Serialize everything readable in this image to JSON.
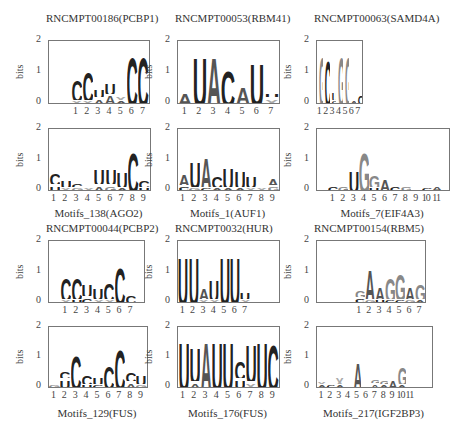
{
  "colors": {
    "dark": "#222222",
    "mid": "#555555",
    "light": "#888888",
    "lighter": "#aaaaaa"
  },
  "axis": {
    "ylabel": "bits",
    "yticks": [
      "0",
      "1",
      "2"
    ]
  },
  "chart_data": [
    {
      "type": "sequence-logo",
      "title": "RNCMPT00186(PCBP1)",
      "caption": "",
      "ylabel": "bits",
      "ylim": [
        0,
        2
      ],
      "positions": [
        "1",
        "2",
        "3",
        "4",
        "5",
        "6",
        "7"
      ],
      "stacks": [
        [
          [
            "X",
            0.1
          ],
          [
            "C",
            0.8
          ]
        ],
        [
          [
            "X",
            0.1
          ],
          [
            "C",
            1.1
          ]
        ],
        [
          [
            "A",
            0.2
          ],
          [
            "U",
            0.3
          ]
        ],
        [
          [
            "A",
            0.3
          ],
          [
            "U",
            0.4
          ]
        ],
        [
          [
            "A",
            0.1
          ],
          [
            "X",
            0.2
          ]
        ],
        [
          [
            "C",
            1.8
          ]
        ],
        [
          [
            "C",
            1.8
          ]
        ]
      ]
    },
    {
      "type": "sequence-logo",
      "title": "RNCMPT00053(RBM41)",
      "caption": "",
      "ylabel": "bits",
      "ylim": [
        0,
        2
      ],
      "positions": [
        "1",
        "2",
        "3",
        "4",
        "5",
        "6",
        "7"
      ],
      "stacks": [
        [
          [
            "A",
            0.4
          ]
        ],
        [
          [
            "U",
            1.8
          ]
        ],
        [
          [
            "A",
            1.8
          ]
        ],
        [
          [
            "C",
            1.3
          ]
        ],
        [
          [
            "A",
            0.6
          ]
        ],
        [
          [
            "U",
            1.6
          ]
        ],
        [
          [
            "X",
            0.2
          ],
          [
            "U",
            0.2
          ]
        ]
      ]
    },
    {
      "type": "sequence-logo",
      "title": "RNCMPT00063(SAMD4A)",
      "caption": "",
      "ylabel": "bits",
      "ylim": [
        0,
        2
      ],
      "positions": [
        "1",
        "2",
        "3",
        "4",
        "5",
        "6",
        "7"
      ],
      "stacks": [
        [
          [
            "G",
            1.8
          ]
        ],
        [
          [
            "C",
            1.7
          ]
        ],
        [
          [
            "C",
            0.1
          ],
          [
            "U",
            0.3
          ]
        ],
        [
          [
            "G",
            1.8
          ]
        ],
        [
          [
            "G",
            1.8
          ]
        ],
        [
          [
            "A",
            0.1
          ]
        ],
        [
          [
            "C",
            0.3
          ]
        ]
      ]
    },
    {
      "type": "sequence-logo",
      "title": "",
      "caption": "Motifs_138(AGO2)",
      "ylabel": "bits",
      "ylim": [
        0,
        2
      ],
      "positions": [
        "1",
        "2",
        "3",
        "4",
        "5",
        "6",
        "7",
        "8",
        "9"
      ],
      "stacks": [
        [
          [
            "U",
            0.2
          ],
          [
            "C",
            0.4
          ]
        ],
        [
          [
            "X",
            0.1
          ],
          [
            "U",
            0.3
          ]
        ],
        [
          [
            "G",
            0.1
          ],
          [
            "C",
            0.2
          ]
        ],
        [
          [
            "X",
            0.1
          ]
        ],
        [
          [
            "A",
            0.2
          ],
          [
            "U",
            0.6
          ]
        ],
        [
          [
            "G",
            0.2
          ],
          [
            "U",
            0.6
          ]
        ],
        [
          [
            "A",
            0.1
          ],
          [
            "U",
            0.6
          ]
        ],
        [
          [
            "C",
            1.5
          ]
        ],
        [
          [
            "U",
            0.1
          ],
          [
            "C",
            0.3
          ]
        ]
      ]
    },
    {
      "type": "sequence-logo",
      "title": "",
      "caption": "Motifs_1(AUF1)",
      "ylabel": "bits",
      "ylim": [
        0,
        2
      ],
      "positions": [
        "1",
        "2",
        "3",
        "4",
        "5",
        "6",
        "7",
        "8",
        "9"
      ],
      "stacks": [
        [
          [
            "C",
            0.15
          ],
          [
            "A",
            0.4
          ]
        ],
        [
          [
            "G",
            0.1
          ],
          [
            "U",
            1.0
          ]
        ],
        [
          [
            "C",
            0.1
          ],
          [
            "A",
            1.2
          ]
        ],
        [
          [
            "A",
            0.1
          ],
          [
            "C",
            0.4
          ]
        ],
        [
          [
            "A",
            0.1
          ],
          [
            "U",
            0.8
          ]
        ],
        [
          [
            "A",
            0.1
          ],
          [
            "U",
            0.7
          ]
        ],
        [
          [
            "X",
            0.1
          ],
          [
            "U",
            0.4
          ]
        ],
        [
          [
            "X",
            0.1
          ]
        ],
        [
          [
            "G",
            0.15
          ],
          [
            "A",
            0.3
          ]
        ]
      ]
    },
    {
      "type": "sequence-logo",
      "title": "",
      "caption": "Motifs_7(EIF4A3)",
      "ylabel": "bits",
      "ylim": [
        0,
        2
      ],
      "positions": [
        "1",
        "2",
        "3",
        "4",
        "5",
        "6",
        "7",
        "8",
        "9",
        "10",
        "11"
      ],
      "stacks": [
        [
          [
            "C",
            0.2
          ]
        ],
        [
          [
            "G",
            0.2
          ]
        ],
        [
          [
            "U",
            0.8
          ]
        ],
        [
          [
            "G",
            1.5
          ]
        ],
        [
          [
            "U",
            0.1
          ],
          [
            "G",
            0.5
          ]
        ],
        [
          [
            "A",
            0.4
          ]
        ],
        [
          [
            "C",
            0.2
          ]
        ],
        [
          [
            "G",
            0.15
          ]
        ],
        [
          [
            "X",
            0.05
          ]
        ],
        [
          [
            "C",
            0.1
          ]
        ],
        [
          [
            "A",
            0.15
          ]
        ]
      ]
    },
    {
      "type": "sequence-logo",
      "title": "RNCMPT00044(PCBP2)",
      "caption": "",
      "ylabel": "bits",
      "ylim": [
        0,
        2
      ],
      "positions": [
        "1",
        "2",
        "3",
        "4",
        "5",
        "6",
        "7"
      ],
      "stacks": [
        [
          [
            "X",
            0.1
          ],
          [
            "C",
            0.9
          ]
        ],
        [
          [
            "U",
            0.1
          ],
          [
            "C",
            0.9
          ]
        ],
        [
          [
            "C",
            0.2
          ],
          [
            "U",
            0.5
          ]
        ],
        [
          [
            "X",
            0.1
          ],
          [
            "U",
            0.4
          ]
        ],
        [
          [
            "X",
            0.1
          ],
          [
            "C",
            0.7
          ]
        ],
        [
          [
            "C",
            1.4
          ]
        ],
        [
          [
            "C",
            0.3
          ]
        ]
      ]
    },
    {
      "type": "sequence-logo",
      "title": "RNCMPT0032(HUR)",
      "caption": "",
      "ylabel": "bits",
      "ylim": [
        0,
        2
      ],
      "positions": [
        "1",
        "2",
        "3",
        "4",
        "5",
        "6",
        "7"
      ],
      "stacks": [
        [
          [
            "U",
            1.8
          ]
        ],
        [
          [
            "U",
            1.8
          ]
        ],
        [
          [
            "X",
            0.1
          ],
          [
            "A",
            0.4
          ]
        ],
        [
          [
            "X",
            0.1
          ],
          [
            "U",
            0.8
          ]
        ],
        [
          [
            "U",
            1.8
          ]
        ],
        [
          [
            "U",
            1.8
          ]
        ],
        [
          [
            "X",
            0.1
          ],
          [
            "U",
            0.3
          ]
        ]
      ]
    },
    {
      "type": "sequence-logo",
      "title": "RNCMPT00154(RBM5)",
      "caption": "",
      "ylabel": "bits",
      "ylim": [
        0,
        2
      ],
      "positions": [
        "1",
        "2",
        "3",
        "4",
        "5",
        "6",
        "7"
      ],
      "stacks": [
        [
          [
            "C",
            0.15
          ],
          [
            "G",
            0.3
          ]
        ],
        [
          [
            "G",
            0.1
          ],
          [
            "A",
            1.2
          ]
        ],
        [
          [
            "U",
            0.1
          ],
          [
            "A",
            0.5
          ]
        ],
        [
          [
            "C",
            0.1
          ],
          [
            "G",
            0.9
          ]
        ],
        [
          [
            "C",
            0.1
          ],
          [
            "G",
            1.0
          ]
        ],
        [
          [
            "G",
            0.1
          ],
          [
            "A",
            0.5
          ]
        ],
        [
          [
            "A",
            0.1
          ],
          [
            "G",
            0.6
          ]
        ]
      ]
    },
    {
      "type": "sequence-logo",
      "title": "",
      "caption": "Motifs_129(FUS)",
      "ylabel": "bits",
      "ylim": [
        0,
        2
      ],
      "positions": [
        "1",
        "2",
        "3",
        "4",
        "5",
        "6",
        "7",
        "8",
        "9"
      ],
      "stacks": [
        [
          [
            "G",
            0.1
          ]
        ],
        [
          [
            "U",
            0.3
          ],
          [
            "C",
            0.3
          ]
        ],
        [
          [
            "C",
            1.3
          ]
        ],
        [
          [
            "U",
            0.1
          ],
          [
            "C",
            0.4
          ]
        ],
        [
          [
            "C",
            0.1
          ],
          [
            "U",
            0.3
          ]
        ],
        [
          [
            "C",
            0.9
          ]
        ],
        [
          [
            "C",
            1.6
          ]
        ],
        [
          [
            "A",
            0.2
          ],
          [
            "C",
            0.4
          ]
        ],
        [
          [
            "G",
            0.1
          ],
          [
            "U",
            0.4
          ]
        ]
      ]
    },
    {
      "type": "sequence-logo",
      "title": "",
      "caption": "Motifs_176(FUS)",
      "ylabel": "bits",
      "ylim": [
        0,
        2
      ],
      "positions": [
        "1",
        "2",
        "3",
        "4",
        "5",
        "6",
        "7",
        "8",
        "9"
      ],
      "stacks": [
        [
          [
            "U",
            1.9
          ]
        ],
        [
          [
            "A",
            0.2
          ],
          [
            "U",
            1.4
          ]
        ],
        [
          [
            "A",
            1.9
          ]
        ],
        [
          [
            "U",
            1.9
          ]
        ],
        [
          [
            "U",
            1.9
          ]
        ],
        [
          [
            "U",
            0.3
          ],
          [
            "C",
            0.7
          ]
        ],
        [
          [
            "X",
            0.2
          ],
          [
            "U",
            1.5
          ]
        ],
        [
          [
            "U",
            1.9
          ]
        ],
        [
          [
            "C",
            1.8
          ]
        ]
      ]
    },
    {
      "type": "sequence-logo",
      "title": "",
      "caption": "Motifs_217(IGF2BP3)",
      "ylabel": "bits",
      "ylim": [
        0,
        2
      ],
      "positions": [
        "1",
        "2",
        "3",
        "4",
        "5",
        "6",
        "7",
        "8",
        "9",
        "10",
        "11"
      ],
      "stacks": [
        [
          [
            "A",
            0.1
          ],
          [
            "X",
            0.15
          ]
        ],
        [
          [
            "C",
            0.1
          ]
        ],
        [
          [
            "A",
            0.1
          ],
          [
            "X",
            0.35
          ]
        ],
        [
          [
            "C",
            0.05
          ]
        ],
        [
          [
            "A",
            1.0
          ]
        ],
        [
          [
            "C",
            0.05
          ]
        ],
        [
          [
            "A",
            0.15
          ],
          [
            "G",
            0.2
          ]
        ],
        [
          [
            "A",
            0.1
          ],
          [
            "G",
            0.2
          ]
        ],
        [
          [
            "A",
            0.3
          ]
        ],
        [
          [
            "A",
            0.1
          ],
          [
            "G",
            0.7
          ]
        ],
        [
          [
            "X",
            0.02
          ]
        ]
      ]
    }
  ]
}
